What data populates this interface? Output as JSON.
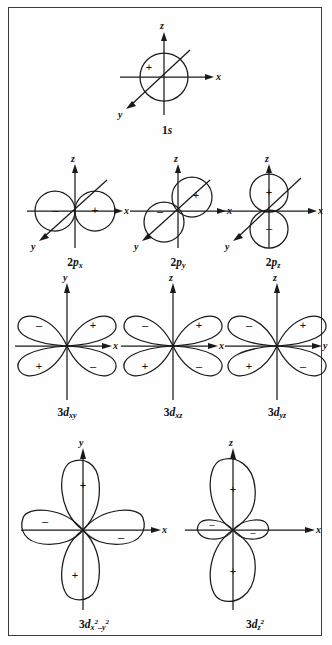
{
  "figure": {
    "border_color": "#3b3b3b",
    "ink_color": "#1a1a1a",
    "background": "#fefefe",
    "axis_labels": {
      "x": "x",
      "y": "y",
      "z": "z"
    },
    "sign_positive": "+",
    "sign_negative": "–"
  },
  "rows": [
    {
      "row_name": "s-orbital-row",
      "orbitals": [
        {
          "name": "1s",
          "caption_main": "1",
          "caption_sub_italic": "s",
          "type": "sphere",
          "axes_shown": [
            "z",
            "x",
            "y"
          ],
          "lobes": [
            {
              "sign": "+",
              "position": "center"
            }
          ]
        }
      ]
    },
    {
      "row_name": "p-orbital-row",
      "orbitals": [
        {
          "name": "2px",
          "caption_main": "2",
          "caption_italic": "p",
          "caption_sub": "x",
          "type": "two-spheres-horizontal",
          "axes_shown": [
            "z",
            "x",
            "y"
          ],
          "lobes": [
            {
              "sign": "–",
              "position": "left"
            },
            {
              "sign": "+",
              "position": "right"
            }
          ]
        },
        {
          "name": "2py",
          "caption_main": "2",
          "caption_italic": "p",
          "caption_sub": "y",
          "type": "two-spheres-diagonal",
          "axes_shown": [
            "z",
            "x",
            "y"
          ],
          "lobes": [
            {
              "sign": "+",
              "position": "upper-right"
            },
            {
              "sign": "–",
              "position": "lower-left"
            }
          ]
        },
        {
          "name": "2pz",
          "caption_main": "2",
          "caption_italic": "p",
          "caption_sub": "z",
          "type": "two-spheres-vertical",
          "axes_shown": [
            "z",
            "x",
            "y"
          ],
          "lobes": [
            {
              "sign": "+",
              "position": "top"
            },
            {
              "sign": "–",
              "position": "bottom"
            }
          ]
        }
      ]
    },
    {
      "row_name": "d-orbital-row-cloverleaf",
      "orbitals": [
        {
          "name": "3dxy",
          "caption_main": "3",
          "caption_italic": "d",
          "caption_sub": "xy",
          "type": "four-lobe-diagonal",
          "axis_vertical": "y",
          "axis_horizontal": "x",
          "lobes": [
            {
              "sign": "–",
              "position": "upper-left"
            },
            {
              "sign": "+",
              "position": "upper-right"
            },
            {
              "sign": "+",
              "position": "lower-left"
            },
            {
              "sign": "–",
              "position": "lower-right"
            }
          ]
        },
        {
          "name": "3dxz",
          "caption_main": "3",
          "caption_italic": "d",
          "caption_sub": "xz",
          "type": "four-lobe-diagonal",
          "axis_vertical": "z",
          "axis_horizontal": "x",
          "lobes": [
            {
              "sign": "–",
              "position": "upper-left"
            },
            {
              "sign": "+",
              "position": "upper-right"
            },
            {
              "sign": "+",
              "position": "lower-left"
            },
            {
              "sign": "–",
              "position": "lower-right"
            }
          ]
        },
        {
          "name": "3dyz",
          "caption_main": "3",
          "caption_italic": "d",
          "caption_sub": "yz",
          "type": "four-lobe-diagonal",
          "axis_vertical": "z",
          "axis_horizontal": "y",
          "lobes": [
            {
              "sign": "–",
              "position": "upper-left"
            },
            {
              "sign": "+",
              "position": "upper-right"
            },
            {
              "sign": "+",
              "position": "lower-left"
            },
            {
              "sign": "–",
              "position": "lower-right"
            }
          ]
        }
      ]
    },
    {
      "row_name": "d-orbital-row-axial",
      "orbitals": [
        {
          "name": "3dx2-y2",
          "caption_main": "3",
          "caption_italic": "d",
          "caption_sub_base": "x",
          "caption_sub_sup1": "2",
          "caption_sub_mid": "–y",
          "caption_sub_sup2": "2",
          "type": "four-lobe-axial",
          "axis_vertical": "y",
          "axis_horizontal": "x",
          "lobes": [
            {
              "sign": "+",
              "position": "top"
            },
            {
              "sign": "–",
              "position": "left"
            },
            {
              "sign": "–",
              "position": "right"
            },
            {
              "sign": "+",
              "position": "bottom"
            }
          ]
        },
        {
          "name": "3dz2",
          "caption_main": "3",
          "caption_italic": "d",
          "caption_sub_base": "z",
          "caption_sub_sup1": "2",
          "type": "dz2",
          "axis_vertical": "z",
          "axis_horizontal": "x",
          "lobes": [
            {
              "sign": "+",
              "position": "top"
            },
            {
              "sign": "+",
              "position": "bottom"
            },
            {
              "sign": "–",
              "position": "torus-left"
            },
            {
              "sign": "–",
              "position": "torus-right"
            }
          ]
        }
      ]
    }
  ]
}
